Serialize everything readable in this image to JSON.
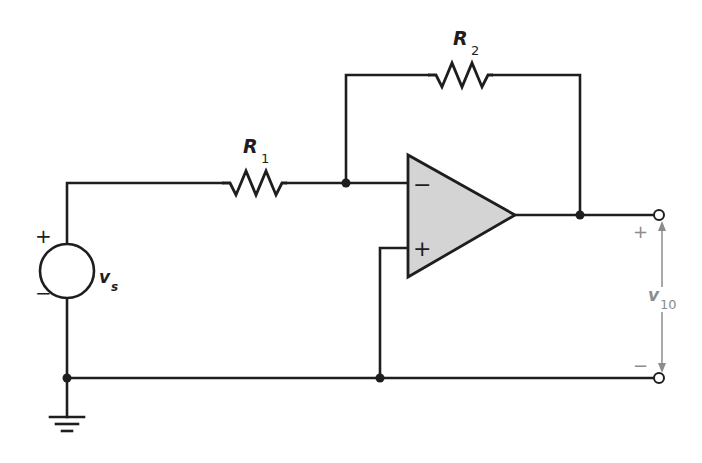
{
  "diagram": {
    "type": "circuit-schematic",
    "colors": {
      "wire": "#1e1e1e",
      "opamp_fill": "#d4d4d4",
      "annotation": "#8c8c8c",
      "background": "#ffffff"
    },
    "components": {
      "source": {
        "label": "v",
        "subscript": "s",
        "plus": "+",
        "minus": "−"
      },
      "r1": {
        "label": "R",
        "subscript": "1"
      },
      "r2": {
        "label": "R",
        "subscript": "2"
      },
      "opamp": {
        "inverting_sign": "−",
        "noninverting_sign": "+"
      },
      "ground": {
        "symbol": "ground-icon"
      }
    },
    "output": {
      "label": "v",
      "subscript": "10",
      "plus": "+",
      "minus": "−"
    },
    "nodes": [
      "source-top",
      "inverting-input-junction",
      "output-junction",
      "ground-junction-left",
      "ground-junction-noninverting",
      "output-terminal-top",
      "output-terminal-bottom"
    ]
  }
}
